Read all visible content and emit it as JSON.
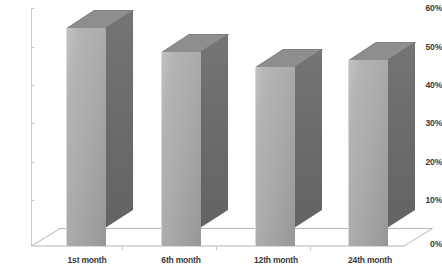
{
  "chart_data": {
    "type": "bar",
    "title": "",
    "subtitle": "",
    "xlabel": "",
    "ylabel": "",
    "categories": [
      "1st month",
      "6th month",
      "12th month",
      "24th month"
    ],
    "values": [
      55,
      49,
      45,
      47
    ],
    "value_labels": [
      "",
      "",
      "",
      ""
    ],
    "ylim": [
      0,
      60
    ],
    "ytick_values": [
      0,
      10,
      20,
      30,
      40,
      50,
      60
    ],
    "ytick_labels": [
      "0%",
      "10%",
      "20%",
      "30%",
      "40%",
      "50%",
      "60%"
    ],
    "grid": false,
    "legend": [],
    "legend_position": "none",
    "style": "3d-column",
    "annotations": []
  },
  "colors": {
    "bar_front_light": "#c2c2c2",
    "bar_front_dark": "#959595",
    "bar_side": "#6b6b6b",
    "bar_top": "#8e8e8e",
    "bar_top_edge": "#707070",
    "axis_line": "#cccccc",
    "tick_mark": "#b9b9b9",
    "floor_line": "#b5b5b5",
    "floor_fill": "#ffffff",
    "text": "#3a3a3a",
    "background": "#ffffff"
  }
}
